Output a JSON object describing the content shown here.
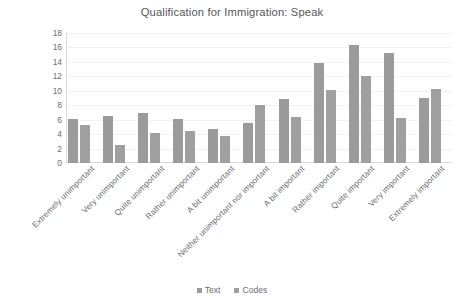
{
  "chart_data": {
    "type": "bar",
    "title": "Qualification for Immigration: Speak",
    "xlabel": "",
    "ylabel": "",
    "ylim": [
      0,
      18
    ],
    "ytick_step": 2,
    "yticks": [
      18,
      16,
      14,
      12,
      10,
      8,
      6,
      4,
      2,
      0
    ],
    "grid": true,
    "legend_position": "bottom",
    "categories": [
      "Extremely unimportant",
      "Very unimportant",
      "Quite unimportant",
      "Rather unimportant",
      "A bit unimportant",
      "Neither unimportant nor important",
      "A bit important",
      "Rather important",
      "Quite important",
      "Very important",
      "Extremely important"
    ],
    "series": [
      {
        "name": "Text",
        "color": "#9b9b9b",
        "values": [
          6.1,
          6.5,
          6.9,
          6.1,
          4.7,
          5.5,
          8.9,
          13.9,
          16.4,
          15.3,
          9.0
        ]
      },
      {
        "name": "Codes",
        "color": "#a0a0a0",
        "values": [
          5.2,
          2.5,
          4.2,
          4.5,
          3.7,
          8.1,
          6.4,
          10.1,
          12.0,
          6.2,
          10.3
        ]
      }
    ]
  }
}
